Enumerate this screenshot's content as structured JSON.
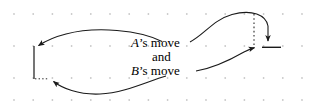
{
  "figure": {
    "background_color": "#ffffff",
    "grid": {
      "dot_color": "#c9c9c9",
      "dot_radius": 0.9,
      "x_start": 14,
      "x_step": 19.2,
      "x_count": 17,
      "rows": [
        14,
        46,
        78,
        100
      ]
    },
    "labels": {
      "a_move_var": "A",
      "a_move_rest": "’s move",
      "and": "and",
      "b_move_var": "B",
      "b_move_rest": "’s move"
    },
    "strokes": {
      "color": "#1a1a1a",
      "width": 1.1,
      "dotted_color": "#2a2a2a"
    },
    "shapes": {
      "left_vertical_line": {
        "x": 34,
        "y1": 46,
        "y2": 79
      },
      "right_tick_line": {
        "x1": 262,
        "x2": 281,
        "y": 47
      },
      "right_dotted_line": {
        "x": 254,
        "y1": 14,
        "y2": 47
      },
      "arrow_a_left": "from A's move label curving left to arrowhead at left vertical line",
      "arrow_a_right": "from A's move label curving up and right, down to arrowhead on right tick line",
      "arrow_b_left": "from B's move label curving down and left to arrowhead near left vertical line base",
      "arrow_b_right": "from B's move label right to arrowhead at right tick line"
    }
  }
}
